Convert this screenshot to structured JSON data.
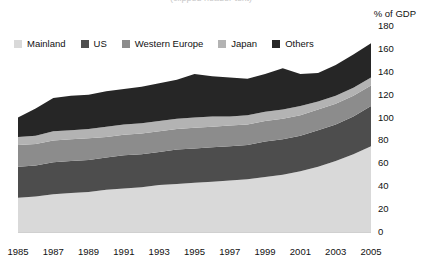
{
  "title": {
    "text": "(clipped header text)"
  },
  "axis": {
    "unit_label": "% of GDP"
  },
  "legend": {
    "items": [
      {
        "label": "Mainland",
        "color": "#d9d9d9"
      },
      {
        "label": "US",
        "color": "#4d4d4d"
      },
      {
        "label": "Western Europe",
        "color": "#8c8c8c"
      },
      {
        "label": "Japan",
        "color": "#b3b3b3"
      },
      {
        "label": "Others",
        "color": "#262626"
      }
    ]
  },
  "chart_data": {
    "type": "area",
    "stacked": true,
    "title": "",
    "xlabel": "",
    "ylabel": "% of GDP",
    "ylim": [
      0,
      180
    ],
    "ytick_step": 20,
    "yticks": [
      0,
      20,
      40,
      60,
      80,
      100,
      120,
      140,
      160,
      180
    ],
    "grid": false,
    "legend_position": "top-left",
    "x": [
      1985,
      1986,
      1987,
      1988,
      1989,
      1990,
      1991,
      1992,
      1993,
      1994,
      1995,
      1996,
      1997,
      1998,
      1999,
      2000,
      2001,
      2002,
      2003,
      2004,
      2005
    ],
    "xtick_labels": [
      "1985",
      "1987",
      "1989",
      "1991",
      "1993",
      "1995",
      "1997",
      "1999",
      "2001",
      "2003",
      "2005"
    ],
    "series": [
      {
        "name": "Mainland",
        "color": "#d9d9d9",
        "values": [
          30,
          31,
          33,
          34,
          35,
          37,
          38,
          39,
          41,
          42,
          43,
          44,
          45,
          46,
          48,
          50,
          53,
          57,
          62,
          68,
          75
        ]
      },
      {
        "name": "US",
        "color": "#4d4d4d",
        "values": [
          27,
          27,
          28,
          28,
          28,
          28,
          29,
          29,
          29,
          30,
          30,
          30,
          30,
          30,
          31,
          31,
          31,
          32,
          32,
          33,
          35
        ]
      },
      {
        "name": "Western Europe",
        "color": "#8c8c8c",
        "values": [
          19,
          19,
          19,
          19,
          19,
          18,
          18,
          18,
          18,
          18,
          18,
          18,
          18,
          18,
          18,
          18,
          18,
          18,
          18,
          18,
          18
        ]
      },
      {
        "name": "Japan",
        "color": "#b3b3b3",
        "values": [
          7,
          7,
          8,
          8,
          8,
          9,
          9,
          9,
          9,
          9,
          9,
          9,
          8,
          8,
          8,
          8,
          8,
          7,
          7,
          7,
          7
        ]
      },
      {
        "name": "Others",
        "color": "#262626",
        "values": [
          17,
          24,
          29,
          30,
          30,
          31,
          31,
          32,
          33,
          34,
          38,
          35,
          34,
          32,
          33,
          36,
          28,
          25,
          27,
          29,
          30
        ]
      }
    ],
    "totals": [
      100,
      108,
      117,
      119,
      120,
      123,
      125,
      127,
      130,
      133,
      138,
      136,
      135,
      134,
      138,
      143,
      138,
      139,
      146,
      155,
      165
    ]
  }
}
